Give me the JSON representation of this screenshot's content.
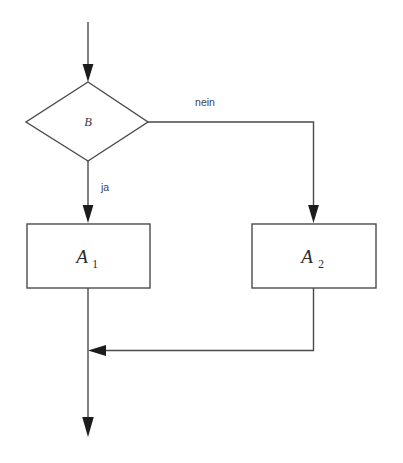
{
  "diagram": {
    "type": "flowchart",
    "language": "de",
    "colors": {
      "background": "#ffffff",
      "stroke": "#4a4a4a",
      "arrow": "#1c1c1c",
      "label_text": "#3d3d3d",
      "node_text": "#2b2b2b"
    },
    "nodes": [
      {
        "id": "condition",
        "shape": "diamond",
        "label": "B",
        "subscript": "",
        "role": "decision"
      },
      {
        "id": "action-1",
        "shape": "rectangle",
        "label": "A",
        "subscript": "1",
        "role": "process"
      },
      {
        "id": "action-2",
        "shape": "rectangle",
        "label": "A",
        "subscript": "2",
        "role": "process"
      }
    ],
    "edges": [
      {
        "id": "entry",
        "from": "",
        "to": "condition",
        "label": "",
        "direction": "down"
      },
      {
        "id": "true-branch",
        "from": "condition",
        "to": "action-1",
        "label": "ja",
        "direction": "down"
      },
      {
        "id": "false-branch",
        "from": "condition",
        "to": "action-2",
        "label": "nein",
        "direction": "right-down"
      },
      {
        "id": "merge-branch",
        "from": "action-2",
        "to": "exit",
        "label": "",
        "direction": "down-left"
      },
      {
        "id": "exit",
        "from": "action-1",
        "to": "",
        "label": "",
        "direction": "down"
      }
    ]
  }
}
